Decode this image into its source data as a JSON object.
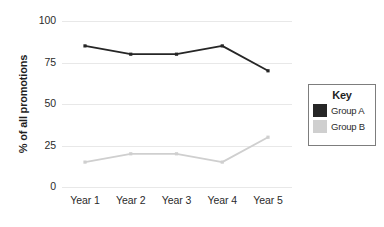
{
  "chart_data": {
    "type": "line",
    "title": "",
    "xlabel": "",
    "ylabel": "% of all promotions",
    "categories": [
      "Year 1",
      "Year 2",
      "Year 3",
      "Year 4",
      "Year 5"
    ],
    "series": [
      {
        "name": "Group A",
        "values": [
          85,
          80,
          80,
          85,
          70
        ],
        "color": "#262626"
      },
      {
        "name": "Group B",
        "values": [
          15,
          20,
          20,
          15,
          30
        ],
        "color": "#cfcfcf"
      }
    ],
    "ylim": [
      0,
      100
    ],
    "yticks": [
      0,
      25,
      50,
      75,
      100
    ],
    "ytick_labels": [
      "0",
      "25",
      "50",
      "75",
      "100"
    ],
    "grid": true,
    "legend_position": "right",
    "legend_title": "Key"
  },
  "legend": {
    "title": "Key",
    "entries": [
      {
        "label": "Group A",
        "color": "#262626"
      },
      {
        "label": "Group B",
        "color": "#cfcfcf"
      }
    ]
  },
  "colors": {
    "group_a": "#262626",
    "group_b": "#cfcfcf",
    "gridline": "#e8e8e8",
    "legend_border": "#7d7d7d",
    "text": "#2b2b2b"
  }
}
